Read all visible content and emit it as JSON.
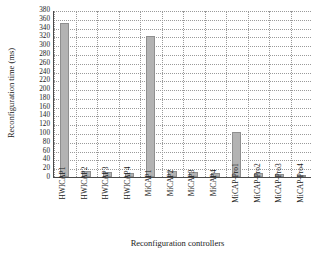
{
  "chart_data": {
    "type": "bar",
    "title": "",
    "xlabel": "Reconfiguration controllers",
    "ylabel": "Reconfiguration time (ms)",
    "ylim": [
      0,
      380
    ],
    "ytick_step": 20,
    "grid": true,
    "legend": "none",
    "bar_color": "#b3b3b3",
    "bar_edge_color": "#8f8f8f",
    "axis_color": "#4a4a4a",
    "grid_color": "#9a9a9a",
    "categories": [
      "HWICAP1",
      "HWICAP2",
      "HWICAP3",
      "HWICAP4",
      "MiCAP1",
      "MiCAP2",
      "MiCAP3",
      "MiCAP4",
      "MiCAP-Pro1",
      "MiCAP-Pro2",
      "MiCAP-Pro3",
      "MiCAP-Pro4"
    ],
    "values": [
      350,
      14,
      12,
      10,
      320,
      13,
      11,
      9,
      103,
      8,
      6,
      5
    ],
    "yticks": [
      "0",
      "20",
      "40",
      "60",
      "80",
      "100",
      "120",
      "140",
      "160",
      "180",
      "200",
      "220",
      "240",
      "260",
      "280",
      "300",
      "320",
      "340",
      "360",
      "380"
    ]
  }
}
